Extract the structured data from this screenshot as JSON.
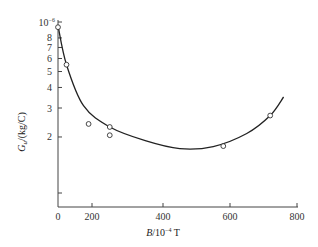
{
  "chart_data": {
    "type": "scatter",
    "title": "",
    "xlabel": "B/10^-4 T",
    "ylabel": "G_u/(kg/C)",
    "y_scale": "log",
    "y_multiplier_label": "10^-6",
    "xlim": [
      0,
      800
    ],
    "ylim": [
      1,
      10
    ],
    "x_ticks": [
      0,
      200,
      400,
      600,
      800
    ],
    "x_tick_labels": [
      "0",
      "200",
      "400",
      "600",
      "800"
    ],
    "y_ticks": [
      2,
      3,
      4,
      5,
      6,
      7,
      8,
      10
    ],
    "y_tick_labels": [
      "2",
      "3",
      "4",
      "5",
      "6",
      "7",
      "8",
      "10⁻⁶"
    ],
    "grid": false,
    "legend": null,
    "series": [
      {
        "name": "measured",
        "marker": "open-circle",
        "points": [
          {
            "x": 0,
            "y": 9.3
          },
          {
            "x": 50,
            "y": 5.5
          },
          {
            "x": 180,
            "y": 2.4
          },
          {
            "x": 250,
            "y": 2.3
          },
          {
            "x": 250,
            "y": 2.05
          },
          {
            "x": 580,
            "y": 1.76
          },
          {
            "x": 720,
            "y": 2.7
          }
        ]
      },
      {
        "name": "fitted curve",
        "marker": "none",
        "line": "solid",
        "points": [
          {
            "x": 0,
            "y": 9.5
          },
          {
            "x": 50,
            "y": 5.5
          },
          {
            "x": 150,
            "y": 3.1
          },
          {
            "x": 250,
            "y": 2.3
          },
          {
            "x": 350,
            "y": 1.9
          },
          {
            "x": 450,
            "y": 1.7
          },
          {
            "x": 550,
            "y": 1.75
          },
          {
            "x": 650,
            "y": 2.1
          },
          {
            "x": 720,
            "y": 2.7
          },
          {
            "x": 760,
            "y": 3.5
          }
        ]
      }
    ]
  },
  "labels": {
    "y_exponent": "10",
    "y_exponent_sup": "−6",
    "ylabel_main": "G",
    "ylabel_sub": "u",
    "ylabel_unit": "/(kg/C)",
    "xlabel_main": "B",
    "xlabel_unit_pre": "/10",
    "xlabel_unit_sup": "−4",
    "xlabel_unit_post": " T"
  }
}
